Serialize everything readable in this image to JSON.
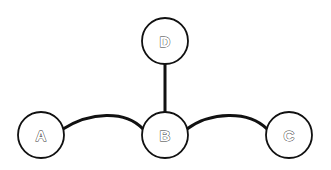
{
  "diagram": {
    "type": "tree-graph",
    "nodes": [
      {
        "id": "A",
        "label": "A"
      },
      {
        "id": "B",
        "label": "B"
      },
      {
        "id": "C",
        "label": "C"
      },
      {
        "id": "D",
        "label": "D"
      }
    ],
    "edges": [
      {
        "from": "A",
        "to": "B",
        "style": "curved"
      },
      {
        "from": "B",
        "to": "C",
        "style": "curved"
      },
      {
        "from": "D",
        "to": "B",
        "style": "straight"
      }
    ],
    "colors": {
      "stroke": "#111111",
      "fill": "#ffffff"
    }
  }
}
